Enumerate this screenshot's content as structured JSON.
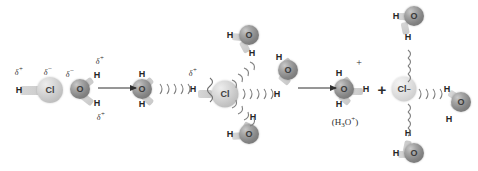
{
  "diagram": {
    "type": "reaction-mechanism",
    "colors": {
      "oxygen": "#838383",
      "chlorine": "#c2c2c2",
      "chloride_ion": "#d2d2d2",
      "text": "#2b2b2b",
      "background": "#ffffff"
    },
    "atoms": {
      "hydrogen": "H",
      "oxygen": "O",
      "chlorine": "Cl",
      "chloride": "Cl",
      "chloride_charge": "−"
    },
    "stages": [
      {
        "id": "stage-1",
        "name": "polar-hcl-and-water",
        "species": [
          "HCl",
          "H2O"
        ],
        "labels": {
          "hcl_h_delta": "δ",
          "hcl_h_delta_sign": "+",
          "hcl_cl_delta": "δ",
          "hcl_cl_delta_sign": "−",
          "water_o_delta": "δ",
          "water_o_delta_sign": "−",
          "water_h_top_delta": "δ",
          "water_h_top_delta_sign": "+",
          "water_h_bottom_delta": "δ",
          "water_h_bottom_delta_sign": "+"
        }
      },
      {
        "id": "stage-2",
        "name": "proton-transfer-solvated-chlorine",
        "species": [
          "H2O",
          "H-Cl breaking",
          "H2O x4"
        ],
        "labels": {
          "transferring_h_delta": "δ",
          "transferring_h_delta_sign": "+"
        },
        "hydrogen_bond_count": 5
      },
      {
        "id": "stage-3",
        "name": "hydronium-and-hydrated-chloride",
        "species": [
          "H3O+",
          "Cl−",
          "H2O x3"
        ],
        "labels": {
          "hydronium_charge": "+",
          "hydronium_formula_open": "(H",
          "hydronium_formula_sub": "3",
          "hydronium_formula_o": "O",
          "hydronium_formula_sup": "+",
          "hydronium_formula_close": ")",
          "separator_plus": "+"
        }
      }
    ],
    "arrows": [
      {
        "name": "arrow-stage1-to-stage2",
        "from_x": 98,
        "to_x": 140,
        "y": 88
      },
      {
        "name": "arrow-stage2-to-stage3",
        "from_x": 298,
        "to_x": 340,
        "y": 88
      }
    ]
  }
}
